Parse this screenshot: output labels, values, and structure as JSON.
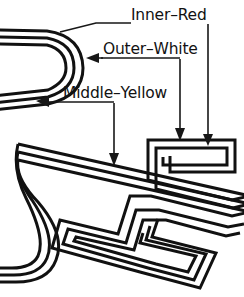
{
  "figure": {
    "background_color": "#ffffff",
    "line_color": "#111111",
    "canvas": {
      "width": 244,
      "height": 297
    }
  },
  "labels": {
    "inner": {
      "text": "Inner–Red",
      "x": 131,
      "y": 20,
      "leader_target_x": 208,
      "leader_target_y": 142,
      "layer_color": "#d42a21"
    },
    "outer": {
      "text": "Outer–White",
      "x": 103,
      "y": 54,
      "leader_target_x": 180,
      "leader_target_y": 140,
      "layer_color": "#ffffff"
    },
    "middle": {
      "text": "Middle–Yellow",
      "x": 63,
      "y": 98,
      "leader_target_x": 114,
      "leader_target_y": 165,
      "layer_color": "#f2c417"
    }
  },
  "leaders": [
    {
      "name": "inner-red-leader-right",
      "points": "208,24 208,138",
      "arrow_at": "bottom",
      "arrow_x": 208,
      "arrow_y": 142
    },
    {
      "name": "inner-red-leader-left",
      "points": "131,24 96,24 58,33",
      "arrow_at": "none",
      "arrow_x": 58,
      "arrow_y": 33
    },
    {
      "name": "outer-white-leader-right",
      "points": "180,58 180,134",
      "arrow_at": "bottom",
      "arrow_x": 180,
      "arrow_y": 140
    },
    {
      "name": "outer-white-leader-left",
      "points": "103,58 97,58",
      "arrow_at": "left",
      "arrow_x": 88,
      "arrow_y": 58
    },
    {
      "name": "middle-yellow-leader-down",
      "points": "114,102 114,158",
      "arrow_at": "bottom",
      "arrow_x": 114,
      "arrow_y": 165
    },
    {
      "name": "middle-yellow-leader-left",
      "points": "63,102 45,102",
      "arrow_at": "left",
      "arrow_x": 37,
      "arrow_y": 101
    }
  ],
  "path_structure": {
    "description": "Three nested parallel traces forming a multi-filar band",
    "filament_count": 3,
    "segments": [
      {
        "name": "upper-left-hairpin",
        "type": "u-turn",
        "orientation": "left"
      },
      {
        "name": "lower-left-hairpin",
        "type": "u-turn",
        "orientation": "left"
      },
      {
        "name": "diagonal-band",
        "type": "straight",
        "orientation": "diagonal"
      },
      {
        "name": "right-meander",
        "type": "serpentine",
        "orientation": "right"
      }
    ]
  }
}
